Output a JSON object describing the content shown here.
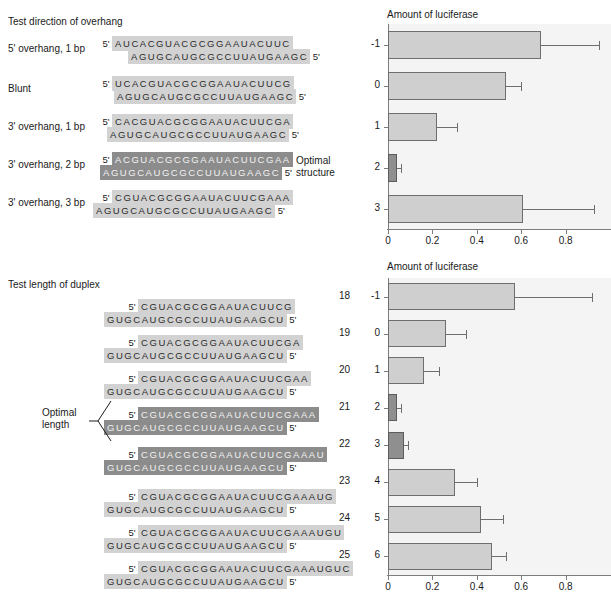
{
  "figure": {
    "panel_a": {
      "title": "Test direction of overhang",
      "rows": [
        {
          "label": "5' overhang, 1 bp",
          "top_prime": "5'",
          "top_seq": "AUCACGUACGCGGAAUACUUC",
          "bottom_seq": "AGUGCAUGCGCCUUAUGAAGC",
          "bottom_prime": "5'",
          "highlight": false,
          "top_indent": 0,
          "bottom_indent": 14
        },
        {
          "label": "Blunt",
          "top_prime": "5'",
          "top_seq": "UCACGUACGCGGAAUACUUCG",
          "bottom_seq": "AGUGCAUGCGCCUUAUGAAGC",
          "bottom_prime": "5'",
          "highlight": false,
          "top_indent": 0,
          "bottom_indent": 0
        },
        {
          "label": "3' overhang, 1 bp",
          "top_prime": "5'",
          "top_seq": "CACGUACGCGGAAUACUUCGA",
          "bottom_seq": "AGUGCAUGCGCCUUAUGAAGC",
          "bottom_prime": "5'",
          "highlight": false,
          "top_indent": 0,
          "bottom_indent": -7
        },
        {
          "label": "3' overhang, 2 bp",
          "top_prime": "5'",
          "top_seq": "ACGUACGCGGAAUACUUCGAA",
          "bottom_seq": "AGUGCAUGCGCCUUAUGAAGC",
          "bottom_prime": "5'",
          "highlight": true,
          "top_indent": 0,
          "bottom_indent": -14,
          "note": "Optimal\nstructure"
        },
        {
          "label": "3' overhang, 3 bp",
          "top_prime": "5'",
          "top_seq": "CGUACGCGGAAUACUUCGAAA",
          "bottom_seq": "AGUGCAUGCGCCUUAUGAAGC",
          "bottom_prime": "5'",
          "highlight": false,
          "top_indent": 0,
          "bottom_indent": -21
        }
      ],
      "note_optimal_structure_line1": "Optimal",
      "note_optimal_structure_line2": "structure"
    },
    "panel_b": {
      "title": "Test length of duplex",
      "bracket_label_line1": "Optimal",
      "bracket_label_line2": "length",
      "rows": [
        {
          "length": "18",
          "top_prime": "5'",
          "top_seq": "CGUACGCGGAAUACUUCG",
          "bottom_seq": "GUGCAUGCGCCUUAUGAAGCU",
          "bottom_prime": "5'",
          "highlight": false
        },
        {
          "length": "19",
          "top_prime": "5'",
          "top_seq": "CGUACGCGGAAUACUUCGA",
          "bottom_seq": "GUGCAUGCGCCUUAUGAAGCU",
          "bottom_prime": "5'",
          "highlight": false
        },
        {
          "length": "20",
          "top_prime": "5'",
          "top_seq": "CGUACGCGGAAUACUUCGAA",
          "bottom_seq": "GUGCAUGCGCCUUAUGAAGCU",
          "bottom_prime": "5'",
          "highlight": false
        },
        {
          "length": "21",
          "top_prime": "5'",
          "top_seq": "CGUACGCGGAAUACUUCGAAA",
          "bottom_seq": "GUGCAUGCGCCUUAUGAAGCU",
          "bottom_prime": "5'",
          "highlight": true
        },
        {
          "length": "22",
          "top_prime": "5'",
          "top_seq": "CGUACGCGGAAUACUUCGAAAU",
          "bottom_seq": "GUGCAUGCGCCUUAUGAAGCU",
          "bottom_prime": "5'",
          "highlight": true
        },
        {
          "length": "23",
          "top_prime": "5'",
          "top_seq": "CGUACGCGGAAUACUUCGAAAUG",
          "bottom_seq": "GUGCAUGCGCCUUAUGAAGCU",
          "bottom_prime": "5'",
          "highlight": false
        },
        {
          "length": "24",
          "top_prime": "5'",
          "top_seq": "CGUACGCGGAAUACUUCGAAAUGU",
          "bottom_seq": "GUGCAUGCGCCUUAUGAAGCU",
          "bottom_prime": "5'",
          "highlight": false
        },
        {
          "length": "25",
          "top_prime": "5'",
          "top_seq": "CGUACGCGGAAUACUUCGAAAUGUC",
          "bottom_seq": "GUGCAUGCGCCUUAUGAAGCU",
          "bottom_prime": "5'",
          "highlight": false
        }
      ]
    }
  },
  "chart_data": [
    {
      "id": "overhang-chart",
      "type": "bar",
      "orientation": "horizontal",
      "title": "Amount of luciferase",
      "xlabel": "",
      "ylabel": "",
      "categories": [
        "-1",
        "0",
        "1",
        "2",
        "3"
      ],
      "values": [
        0.69,
        0.53,
        0.22,
        0.04,
        0.61
      ],
      "errors_upper": [
        0.26,
        0.07,
        0.09,
        0.02,
        0.32
      ],
      "highlight_index": 3,
      "xlim": [
        0,
        1.0
      ],
      "xticks": [
        0,
        0.2,
        0.4,
        0.6,
        0.8
      ],
      "xticklabels": [
        "0",
        "0.2",
        "0.4",
        "0.6",
        "0.8"
      ],
      "grid": false,
      "legend": "none"
    },
    {
      "id": "length-chart",
      "type": "bar",
      "orientation": "horizontal",
      "title": "Amount of luciferase",
      "xlabel": "",
      "ylabel": "",
      "categories": [
        "-1",
        "0",
        "1",
        "2",
        "3",
        "4",
        "5",
        "6"
      ],
      "duplex_lengths": [
        "18",
        "19",
        "20",
        "21",
        "22",
        "23",
        "24",
        "25"
      ],
      "values": [
        0.57,
        0.26,
        0.16,
        0.04,
        0.07,
        0.3,
        0.42,
        0.47
      ],
      "errors_upper": [
        0.35,
        0.09,
        0.07,
        0.02,
        0.02,
        0.1,
        0.1,
        0.06
      ],
      "highlight_indices": [
        3,
        4
      ],
      "xlim": [
        0,
        1.0
      ],
      "xticks": [
        0,
        0.2,
        0.4,
        0.6,
        0.8
      ],
      "xticklabels": [
        "0",
        "0.2",
        "0.4",
        "0.6",
        "0.8"
      ],
      "grid": false,
      "legend": "none"
    }
  ],
  "colors": {
    "bar_fill": "#cfcfcf",
    "bar_highlight": "#8f8f8f",
    "bar_stroke": "#6e6e6e",
    "plot_bg": "#f4f4f4",
    "seq_bg": "#d2d2d2",
    "seq_bg_highlight": "#8c8c8c",
    "text": "#1a1a1a"
  }
}
